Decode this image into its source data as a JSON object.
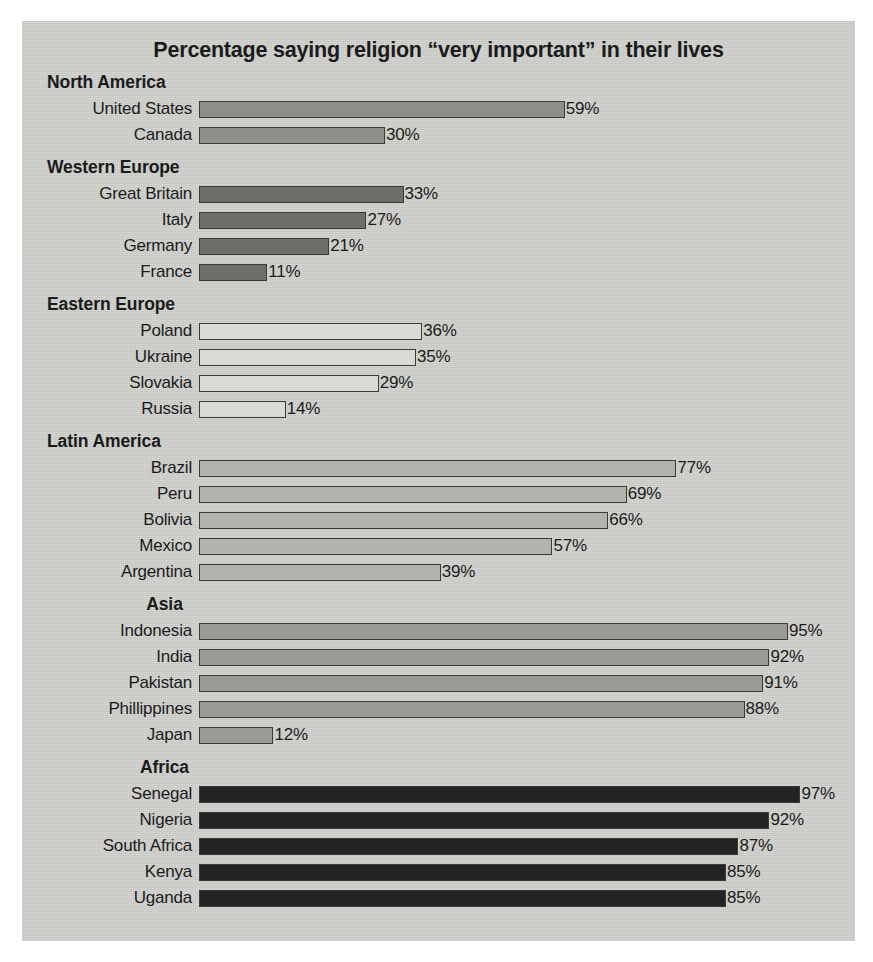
{
  "chart_data": {
    "type": "bar",
    "title": "Percentage saying religion “very important” in their lives",
    "xlabel": "",
    "ylabel": "",
    "xlim": [
      0,
      100
    ],
    "grid": false,
    "legend": "none",
    "orientation": "horizontal",
    "value_suffix": "%",
    "px_per_percent": 6.2,
    "groups": [
      {
        "name": "North America",
        "header_align": "left",
        "bar_color": "#8f8f8c",
        "categories": [
          "United States",
          "Canada"
        ],
        "values": [
          59,
          30
        ],
        "labels": [
          "59%",
          "30%"
        ]
      },
      {
        "name": "Western Europe",
        "header_align": "left",
        "bar_color": "#6e6e6b",
        "categories": [
          "Great Britain",
          "Italy",
          "Germany",
          "France"
        ],
        "values": [
          33,
          27,
          21,
          11
        ],
        "labels": [
          "33%",
          "27%",
          "21%",
          "11%"
        ]
      },
      {
        "name": "Eastern Europe",
        "header_align": "left",
        "bar_color": "#d9d9d6",
        "categories": [
          "Poland",
          "Ukraine",
          "Slovakia",
          "Russia"
        ],
        "values": [
          36,
          35,
          29,
          14
        ],
        "labels": [
          "36%",
          "35%",
          "29%",
          "14%"
        ]
      },
      {
        "name": "Latin America",
        "header_align": "left",
        "bar_color": "#b2b2ae",
        "categories": [
          "Brazil",
          "Peru",
          "Bolivia",
          "Mexico",
          "Argentina"
        ],
        "values": [
          77,
          69,
          66,
          57,
          39
        ],
        "labels": [
          "77%",
          "69%",
          "66%",
          "57%",
          "39%"
        ]
      },
      {
        "name": "Asia",
        "header_align": "center",
        "bar_color": "#9a9a97",
        "categories": [
          "Indonesia",
          "India",
          "Pakistan",
          "Phillippines",
          "Japan"
        ],
        "values": [
          95,
          92,
          91,
          88,
          12
        ],
        "labels": [
          "95%",
          "92%",
          "91%",
          "88%",
          "12%"
        ]
      },
      {
        "name": "Africa",
        "header_align": "center",
        "bar_color": "#232323",
        "categories": [
          "Senegal",
          "Nigeria",
          "South Africa",
          "Kenya",
          "Uganda"
        ],
        "values": [
          97,
          92,
          87,
          85,
          85
        ],
        "labels": [
          "97%",
          "92%",
          "87%",
          "85%",
          "85%"
        ]
      }
    ]
  },
  "colors": {
    "panel_background": "#cfcfcc",
    "page_background": "#ffffff",
    "text": "#1b1b1b",
    "bar_outline": "#3a3a3a"
  }
}
